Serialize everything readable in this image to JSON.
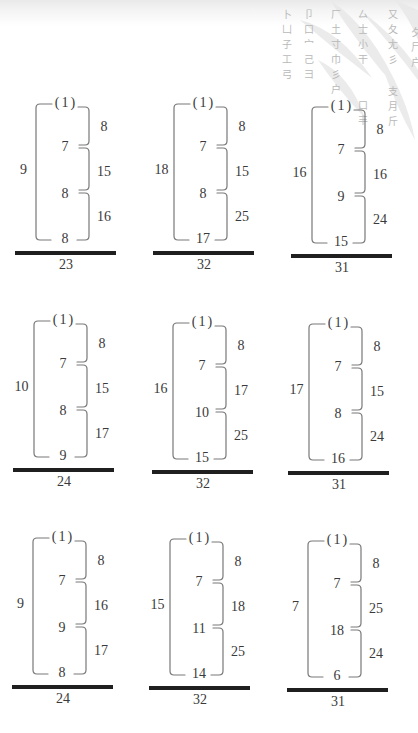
{
  "watermark": {
    "columns": [
      {
        "chars": "卜凵子工弓"
      },
      {
        "chars": "卩口宀己彐"
      },
      {
        "chars": "厂土寸巾彡户"
      },
      {
        "chars": "厶士小干"
      },
      {
        "chars": "又夂尢彡"
      },
      {
        "chars": "夕尸户"
      },
      {
        "chars": "口丰"
      },
      {
        "chars": "支月斤"
      }
    ]
  },
  "puzzles": [
    {
      "top": "(1)",
      "left": "9",
      "middle": [
        "7",
        "8"
      ],
      "bottom": "8",
      "right": [
        "8",
        "15",
        "16"
      ],
      "total": "23"
    },
    {
      "top": "(1)",
      "left": "18",
      "middle": [
        "7",
        "8"
      ],
      "bottom": "17",
      "right": [
        "8",
        "15",
        "25"
      ],
      "total": "32"
    },
    {
      "top": "(1)",
      "left": "16",
      "middle": [
        "7",
        "9"
      ],
      "bottom": "15",
      "right": [
        "8",
        "16",
        "24"
      ],
      "total": "31"
    },
    {
      "top": "(1)",
      "left": "10",
      "middle": [
        "7",
        "8"
      ],
      "bottom": "9",
      "right": [
        "8",
        "15",
        "17"
      ],
      "total": "24"
    },
    {
      "top": "(1)",
      "left": "16",
      "middle": [
        "7",
        "10"
      ],
      "bottom": "15",
      "right": [
        "8",
        "17",
        "25"
      ],
      "total": "32"
    },
    {
      "top": "(1)",
      "left": "17",
      "middle": [
        "7",
        "8"
      ],
      "bottom": "16",
      "right": [
        "8",
        "15",
        "24"
      ],
      "total": "31"
    },
    {
      "top": "(1)",
      "left": "9",
      "middle": [
        "7",
        "9"
      ],
      "bottom": "8",
      "right": [
        "8",
        "16",
        "17"
      ],
      "total": "24"
    },
    {
      "top": "(1)",
      "left": "15",
      "middle": [
        "7",
        "11"
      ],
      "bottom": "14",
      "right": [
        "8",
        "18",
        "25"
      ],
      "total": "32"
    },
    {
      "top": "(1)",
      "left": "7",
      "middle": [
        "7",
        "18"
      ],
      "bottom": "6",
      "right": [
        "8",
        "25",
        "24"
      ],
      "total": "31"
    }
  ]
}
